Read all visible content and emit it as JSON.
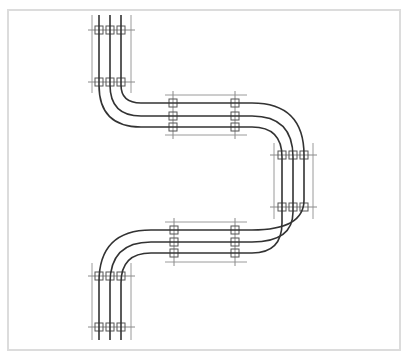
{
  "diagram": {
    "colors": {
      "rail": "#333333",
      "bound": "#9a9a9a",
      "frame": "#dcdcdc",
      "background": "#ffffff"
    },
    "conductor_count": 3,
    "sections": [
      {
        "name": "top-vertical",
        "orientation": "vertical",
        "clamp_rows": 2
      },
      {
        "name": "upper-horizontal",
        "orientation": "horizontal",
        "clamp_rows": 2
      },
      {
        "name": "right-vertical",
        "orientation": "vertical",
        "clamp_rows": 2
      },
      {
        "name": "lower-horizontal",
        "orientation": "horizontal",
        "clamp_rows": 2
      },
      {
        "name": "bottom-vertical",
        "orientation": "vertical",
        "clamp_rows": 2
      }
    ]
  }
}
